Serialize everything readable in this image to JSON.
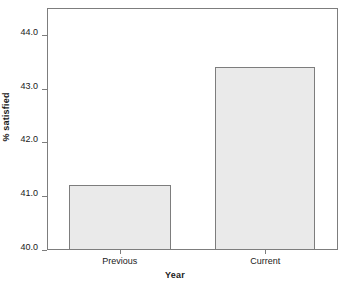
{
  "chart_data": {
    "type": "bar",
    "title": "",
    "categories": [
      "Previous",
      "Current"
    ],
    "values": [
      41.2,
      43.4
    ],
    "xlabel": "Year",
    "ylabel": "% satisfied",
    "ylim": [
      40.0,
      44.5
    ],
    "yticks": [
      "40.0",
      "41.0",
      "42.0",
      "43.0",
      "44.0"
    ],
    "ytick_values": [
      40.0,
      41.0,
      42.0,
      43.0,
      44.0
    ],
    "grid": false,
    "legend": false,
    "bar_fill_color": "#eaeaea",
    "bar_border_color": "#7d7d7d",
    "axis_color": "#7d7d7d",
    "background_color": "#ffffff",
    "text_color": "#1a1a1a"
  }
}
